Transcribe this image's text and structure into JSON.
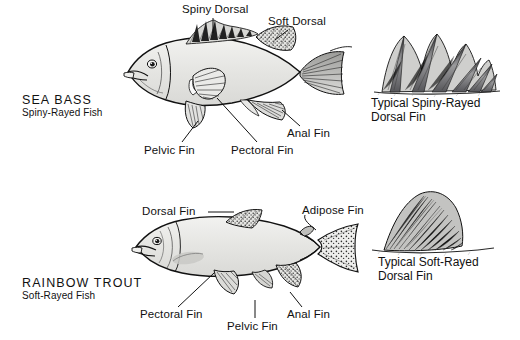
{
  "diagram": {
    "background_color": "#ffffff",
    "ink_color": "#000000",
    "body_fill_color": "#e9e9e7"
  },
  "specimens": [
    {
      "id": "sea-bass",
      "name": "SEA BASS",
      "subtitle": "Spiny-Rayed Fish",
      "callouts": [
        {
          "id": "spiny-dorsal",
          "label": "Spiny Dorsal"
        },
        {
          "id": "soft-dorsal",
          "label": "Soft Dorsal"
        },
        {
          "id": "pelvic-fin",
          "label": "Pelvic Fin"
        },
        {
          "id": "pectoral-fin",
          "label": "Pectoral Fin"
        },
        {
          "id": "anal-fin",
          "label": "Anal Fin"
        }
      ],
      "inset": {
        "id": "spiny-rayed-dorsal-fin",
        "caption_line1": "Typical Spiny-Rayed",
        "caption_line2": "Dorsal Fin"
      }
    },
    {
      "id": "rainbow-trout",
      "name": "RAINBOW TROUT",
      "subtitle": "Soft-Rayed Fish",
      "callouts": [
        {
          "id": "dorsal-fin",
          "label": "Dorsal Fin"
        },
        {
          "id": "adipose-fin",
          "label": "Adipose Fin"
        },
        {
          "id": "pectoral-fin",
          "label": "Pectoral Fin"
        },
        {
          "id": "pelvic-fin",
          "label": "Pelvic Fin"
        },
        {
          "id": "anal-fin",
          "label": "Anal Fin"
        }
      ],
      "inset": {
        "id": "soft-rayed-dorsal-fin",
        "caption_line1": "Typical Soft-Rayed",
        "caption_line2": "Dorsal Fin"
      }
    }
  ]
}
